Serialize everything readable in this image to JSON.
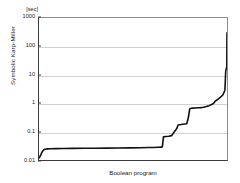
{
  "chart_data": {
    "type": "line",
    "title": "",
    "subtitle": "",
    "xlabel": "Boolean program",
    "ylabel": "Symbolic Karp-Miller",
    "unit_label": "[sec]",
    "yscale": "log",
    "ylim": [
      0.01,
      1000
    ],
    "xlim": [
      0,
      100
    ],
    "grid": true,
    "legend": "none",
    "ytick_labels": [
      "1000",
      "100",
      "10",
      "1",
      "0.1",
      "0.01"
    ],
    "ytick_values": [
      1000,
      100,
      10,
      1,
      0.1,
      0.01
    ],
    "series": [
      {
        "name": "Symbolic Karp-Miller",
        "color": "#111111",
        "x": [
          0,
          0.6,
          1.2,
          1.8,
          2.4,
          3.2,
          4.5,
          6.0,
          9.0,
          13.0,
          18.0,
          24.0,
          30.0,
          36.0,
          42.0,
          48.0,
          54.0,
          58.0,
          61.0,
          63.5,
          65.0,
          65.6,
          66.2,
          67.5,
          69.0,
          70.5,
          72.0,
          73.2,
          74.0,
          74.8,
          75.6,
          76.4,
          77.4,
          78.6,
          79.4,
          80.2,
          81.0,
          82.0,
          83.0,
          84.5,
          86.0,
          87.5,
          89.0,
          90.5,
          91.8,
          92.8,
          93.6,
          94.3,
          95.0,
          95.6,
          96.1,
          96.6,
          97.0,
          97.4,
          97.7,
          98.0,
          98.3,
          98.6,
          98.9,
          99.1,
          99.3,
          99.5,
          99.65,
          99.78,
          99.88,
          99.95,
          100
        ],
        "y": [
          0.0118,
          0.0135,
          0.0165,
          0.02,
          0.0225,
          0.024,
          0.0247,
          0.025,
          0.0252,
          0.0254,
          0.0256,
          0.0258,
          0.026,
          0.0262,
          0.0265,
          0.0268,
          0.0271,
          0.0274,
          0.0277,
          0.028,
          0.0283,
          0.029,
          0.065,
          0.067,
          0.069,
          0.072,
          0.098,
          0.125,
          0.17,
          0.175,
          0.178,
          0.182,
          0.186,
          0.19,
          0.3,
          0.64,
          0.66,
          0.67,
          0.68,
          0.69,
          0.7,
          0.72,
          0.76,
          0.82,
          0.9,
          0.98,
          1.15,
          1.25,
          1.35,
          1.45,
          1.55,
          1.65,
          1.75,
          1.85,
          1.95,
          2.1,
          2.3,
          2.6,
          3.0,
          6.0,
          13.0,
          15.5,
          16.0,
          18.0,
          20.0,
          120.0,
          300.0
        ]
      }
    ]
  },
  "axes": {
    "y_ticks": [
      {
        "label": "1000",
        "value": 1000
      },
      {
        "label": "100",
        "value": 100
      },
      {
        "label": "10",
        "value": 10
      },
      {
        "label": "1",
        "value": 1
      },
      {
        "label": "0.1",
        "value": 0.1
      },
      {
        "label": "0.01",
        "value": 0.01
      }
    ]
  }
}
